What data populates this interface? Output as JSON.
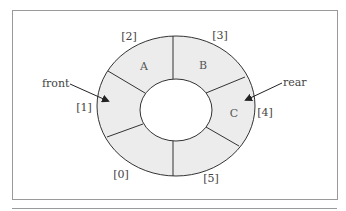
{
  "diagram": {
    "type": "circular-queue",
    "slots": [
      {
        "index": "[0]",
        "value": ""
      },
      {
        "index": "[1]",
        "value": ""
      },
      {
        "index": "[2]",
        "value": "A"
      },
      {
        "index": "[3]",
        "value": "B"
      },
      {
        "index": "[4]",
        "value": "C"
      },
      {
        "index": "[5]",
        "value": ""
      }
    ],
    "pointers": {
      "front": "front",
      "rear": "rear"
    },
    "colors": {
      "fill": "#ececec",
      "stroke": "#333333",
      "frame": "#9a9a9a"
    }
  }
}
